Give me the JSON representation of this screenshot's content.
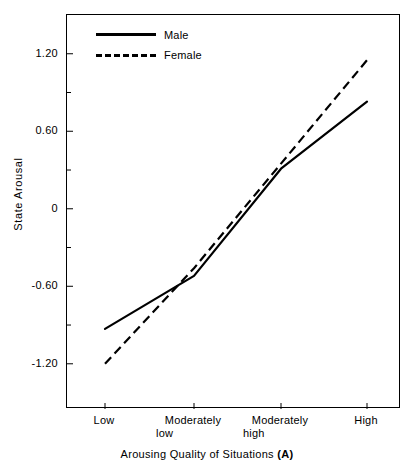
{
  "chart_data": {
    "type": "line",
    "title": "",
    "xlabel": "Arousing Quality of Situations (A)",
    "xlabel_plain": "Arousing Quality of Situations",
    "xlabel_bold_suffix": "(A)",
    "ylabel": "State Arousal",
    "categories": [
      "Low",
      "Moderately low",
      "Moderately high",
      "High"
    ],
    "category_lines": [
      [
        "Low"
      ],
      [
        "Moderately",
        "low"
      ],
      [
        "Moderately",
        "high"
      ],
      [
        "High"
      ]
    ],
    "ylim": [
      -1.55,
      1.5
    ],
    "yticks": [
      1.2,
      0.6,
      0,
      -0.6,
      -1.2
    ],
    "ytick_labels": [
      "1.20",
      "0.60",
      "0",
      "-0.60",
      "-1.20"
    ],
    "yminor_ticks": [
      0.9,
      0.3,
      -0.3,
      -0.9
    ],
    "grid": false,
    "legend_position": "top-left",
    "series": [
      {
        "name": "Male",
        "style": "solid",
        "color": "#000000",
        "values": [
          -0.93,
          -0.52,
          0.31,
          0.83
        ]
      },
      {
        "name": "Female",
        "style": "dashed",
        "color": "#000000",
        "values": [
          -1.2,
          -0.46,
          0.35,
          1.15
        ]
      }
    ]
  },
  "legend": {
    "male_label": "Male",
    "female_label": "Female"
  },
  "axes": {
    "y_title": "State Arousal",
    "x_title_plain": "Arousing Quality of Situations ",
    "x_title_bold": "(A)",
    "ytick_0": "1.20",
    "ytick_1": "0.60",
    "ytick_2": "0",
    "ytick_3": "-0.60",
    "ytick_4": "-1.20",
    "xtick_0_line1": "Low",
    "xtick_0_line2": "",
    "xtick_1_line1": "Moderately",
    "xtick_1_line2": "low",
    "xtick_2_line1": "Moderately",
    "xtick_2_line2": "high",
    "xtick_3_line1": "High",
    "xtick_3_line2": ""
  }
}
